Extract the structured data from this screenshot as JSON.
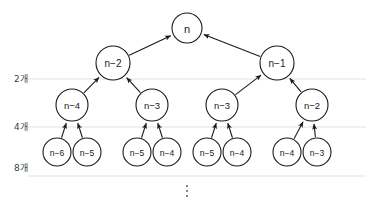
{
  "diagram": {
    "background_color": "#ffffff",
    "node_fill": "#ffffff",
    "node_stroke": "#1a1a1a",
    "gridline_color": "#d9d9d9",
    "text_color": "#1a1a1a",
    "count_label_color": "#404040",
    "ellipsis": "⋮",
    "count_labels": [
      {
        "text": "2개",
        "x": 14,
        "y": 79
      },
      {
        "text": "4개",
        "x": 14,
        "y": 127
      },
      {
        "text": "8개",
        "x": 14,
        "y": 168
      }
    ],
    "gridlines": [
      {
        "name": "level-2-line",
        "y": 79,
        "x1": 28,
        "x2": 366
      },
      {
        "name": "level-3-line",
        "y": 127,
        "x1": 28,
        "x2": 366
      },
      {
        "name": "level-4-line",
        "y": 176,
        "x1": 28,
        "x2": 366
      }
    ],
    "levels": [
      {
        "name": "root",
        "node_radius": 15,
        "font_size": 11,
        "nodes": [
          {
            "id": "r0",
            "label": "n",
            "x": 187,
            "y": 28
          }
        ]
      },
      {
        "name": "level-2",
        "node_radius": 17,
        "font_size": 10,
        "nodes": [
          {
            "id": "a0",
            "label": "n−2",
            "x": 113,
            "y": 63
          },
          {
            "id": "a1",
            "label": "n−1",
            "x": 277,
            "y": 63
          }
        ]
      },
      {
        "name": "level-3",
        "node_radius": 16,
        "font_size": 9.5,
        "nodes": [
          {
            "id": "b0",
            "label": "n−4",
            "x": 72,
            "y": 105
          },
          {
            "id": "b1",
            "label": "n−3",
            "x": 152,
            "y": 105
          },
          {
            "id": "b2",
            "label": "n−3",
            "x": 222,
            "y": 105
          },
          {
            "id": "b3",
            "label": "n−2",
            "x": 312,
            "y": 105
          }
        ]
      },
      {
        "name": "level-4",
        "node_radius": 14,
        "font_size": 8.5,
        "nodes": [
          {
            "id": "c0",
            "label": "n−6",
            "x": 57,
            "y": 152
          },
          {
            "id": "c1",
            "label": "n−5",
            "x": 87,
            "y": 152
          },
          {
            "id": "c2",
            "label": "n−5",
            "x": 137,
            "y": 152
          },
          {
            "id": "c3",
            "label": "n−4",
            "x": 167,
            "y": 152
          },
          {
            "id": "c4",
            "label": "n−5",
            "x": 207,
            "y": 152
          },
          {
            "id": "c5",
            "label": "n−4",
            "x": 237,
            "y": 152
          },
          {
            "id": "c6",
            "label": "n−4",
            "x": 287,
            "y": 152
          },
          {
            "id": "c7",
            "label": "n−3",
            "x": 317,
            "y": 152
          }
        ]
      }
    ],
    "edges": [
      {
        "name": "edge-a0-r0",
        "from": "a0",
        "to": "r0"
      },
      {
        "name": "edge-a1-r0",
        "from": "a1",
        "to": "r0"
      },
      {
        "name": "edge-b0-a0",
        "from": "b0",
        "to": "a0"
      },
      {
        "name": "edge-b1-a0",
        "from": "b1",
        "to": "a0"
      },
      {
        "name": "edge-b2-a1",
        "from": "b2",
        "to": "a1"
      },
      {
        "name": "edge-b3-a1",
        "from": "b3",
        "to": "a1"
      },
      {
        "name": "edge-c0-b0",
        "from": "c0",
        "to": "b0"
      },
      {
        "name": "edge-c1-b0",
        "from": "c1",
        "to": "b0"
      },
      {
        "name": "edge-c2-b1",
        "from": "c2",
        "to": "b1"
      },
      {
        "name": "edge-c3-b1",
        "from": "c3",
        "to": "b1"
      },
      {
        "name": "edge-c4-b2",
        "from": "c4",
        "to": "b2"
      },
      {
        "name": "edge-c5-b2",
        "from": "c5",
        "to": "b2"
      },
      {
        "name": "edge-c6-b3",
        "from": "c6",
        "to": "b3"
      },
      {
        "name": "edge-c7-b3",
        "from": "c7",
        "to": "b3"
      }
    ],
    "ellipsis_marker": {
      "x": 187,
      "y": 191
    }
  }
}
